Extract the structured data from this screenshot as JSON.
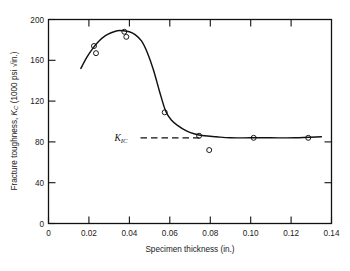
{
  "chart_data": {
    "type": "line",
    "title": "",
    "subtitle": "",
    "xlabel": "Specimen thickness (in.)",
    "ylabel": "Fracture toughness, K_C (1000 psi √in.)",
    "ylabel_main": "Fracture toughness, ",
    "ylabel_symbol": "K",
    "ylabel_symbol_sub": "C",
    "ylabel_units": " (1000 psi √in.)",
    "xlim": [
      0,
      0.14
    ],
    "ylim": [
      0,
      200
    ],
    "xticks": [
      0,
      0.02,
      0.04,
      0.06,
      0.08,
      0.1,
      0.12,
      0.14
    ],
    "xticklabels": [
      "0",
      "0.02",
      "0.04",
      "0.06",
      "0.08",
      "0.10",
      "0.12",
      "0.14"
    ],
    "yticks": [
      0,
      40,
      80,
      120,
      160,
      200
    ],
    "yticklabels": [
      "0",
      "40",
      "80",
      "120",
      "160",
      "200"
    ],
    "grid": false,
    "legend": "none",
    "marker": "open-circle",
    "line_color": "#111111",
    "marker_color": "#111111",
    "series": [
      {
        "name": "Fracture toughness vs thickness",
        "x": [
          0.0225,
          0.0235,
          0.0375,
          0.0385,
          0.0575,
          0.0745,
          0.0795,
          0.1015,
          0.1285
        ],
        "values": [
          174,
          167,
          188,
          183,
          109,
          86,
          72,
          84,
          84
        ]
      }
    ],
    "fitted_curve": {
      "name": "smooth fit curve",
      "x": [
        0.016,
        0.019,
        0.022,
        0.025,
        0.028,
        0.031,
        0.034,
        0.037,
        0.04,
        0.043,
        0.046,
        0.049,
        0.052,
        0.055,
        0.058,
        0.061,
        0.064,
        0.068,
        0.072,
        0.077,
        0.083,
        0.09,
        0.1,
        0.11,
        0.122,
        0.135
      ],
      "values": [
        152,
        163,
        172,
        179,
        184,
        187,
        189,
        189,
        188,
        185,
        179,
        167,
        150,
        129,
        110,
        101,
        96,
        91,
        88,
        86,
        85,
        84,
        84,
        84,
        84,
        85
      ]
    },
    "annotations": [
      {
        "name": "k-ic-reference-line",
        "label": "K",
        "label_sub": "IC",
        "value": 84,
        "style": "dashed",
        "x_start": 0.0455,
        "x_end": 0.0755,
        "label_x": 0.0365
      }
    ]
  }
}
